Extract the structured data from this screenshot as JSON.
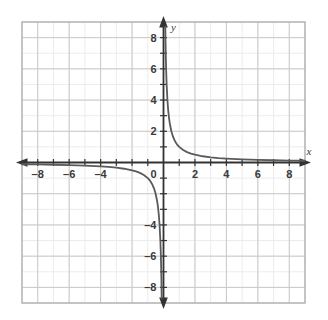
{
  "figure": {
    "kind": "coordinate-plane-graph",
    "background_color": "#ffffff",
    "frame_color": "#b0b0b0",
    "minor_grid_color": "#ececec",
    "major_grid_color": "#c9c9c9",
    "axis_color": "#333333",
    "curve_color": "#5a5a5a",
    "label_color": "#3a3a3a"
  },
  "axes": {
    "x_label": "x",
    "y_label": "y",
    "origin_label": "0",
    "x_ticks": [
      {
        "value": -8,
        "label": "–8"
      },
      {
        "value": -6,
        "label": "–6"
      },
      {
        "value": -4,
        "label": "–4"
      },
      {
        "value": 2,
        "label": "2"
      },
      {
        "value": 4,
        "label": "4"
      },
      {
        "value": 6,
        "label": "6"
      },
      {
        "value": 8,
        "label": "8"
      }
    ],
    "y_ticks": [
      {
        "value": 8,
        "label": "8"
      },
      {
        "value": 6,
        "label": "6"
      },
      {
        "value": 4,
        "label": "4"
      },
      {
        "value": 2,
        "label": "2"
      },
      {
        "value": -4,
        "label": "–4"
      },
      {
        "value": -6,
        "label": "–6"
      },
      {
        "value": -8,
        "label": "–8"
      }
    ]
  },
  "chart_data": {
    "type": "line",
    "title": "",
    "subtitle": "",
    "xlabel": "x",
    "ylabel": "y",
    "xlim": [
      -9,
      9
    ],
    "ylim": [
      -9,
      9
    ],
    "grid": true,
    "grid_step_minor": 1,
    "grid_step_major": 2,
    "legend": null,
    "function": "y = 1/x",
    "asymptotes": {
      "vertical": 0,
      "horizontal": 0
    },
    "series": [
      {
        "name": "branch-quadrant-I",
        "points": [
          [
            0.115,
            8.7
          ],
          [
            0.12,
            8.33
          ],
          [
            0.13,
            7.69
          ],
          [
            0.14,
            7.14
          ],
          [
            0.15,
            6.67
          ],
          [
            0.17,
            5.88
          ],
          [
            0.2,
            5.0
          ],
          [
            0.25,
            4.0
          ],
          [
            0.3,
            3.33
          ],
          [
            0.35,
            2.86
          ],
          [
            0.4,
            2.5
          ],
          [
            0.5,
            2.0
          ],
          [
            0.6,
            1.67
          ],
          [
            0.7,
            1.43
          ],
          [
            0.8,
            1.25
          ],
          [
            0.9,
            1.11
          ],
          [
            1.0,
            1.0
          ],
          [
            1.25,
            0.8
          ],
          [
            1.5,
            0.667
          ],
          [
            1.75,
            0.571
          ],
          [
            2.0,
            0.5
          ],
          [
            2.5,
            0.4
          ],
          [
            3.0,
            0.333
          ],
          [
            3.5,
            0.286
          ],
          [
            4.0,
            0.25
          ],
          [
            5.0,
            0.2
          ],
          [
            6.0,
            0.167
          ],
          [
            7.0,
            0.143
          ],
          [
            8.0,
            0.125
          ],
          [
            9.0,
            0.111
          ]
        ]
      },
      {
        "name": "branch-quadrant-III",
        "points": [
          [
            -9.0,
            -0.111
          ],
          [
            -8.0,
            -0.125
          ],
          [
            -7.0,
            -0.143
          ],
          [
            -6.0,
            -0.167
          ],
          [
            -5.0,
            -0.2
          ],
          [
            -4.0,
            -0.25
          ],
          [
            -3.5,
            -0.286
          ],
          [
            -3.0,
            -0.333
          ],
          [
            -2.5,
            -0.4
          ],
          [
            -2.0,
            -0.5
          ],
          [
            -1.75,
            -0.571
          ],
          [
            -1.5,
            -0.667
          ],
          [
            -1.25,
            -0.8
          ],
          [
            -1.0,
            -1.0
          ],
          [
            -0.9,
            -1.11
          ],
          [
            -0.8,
            -1.25
          ],
          [
            -0.7,
            -1.43
          ],
          [
            -0.6,
            -1.67
          ],
          [
            -0.5,
            -2.0
          ],
          [
            -0.4,
            -2.5
          ],
          [
            -0.35,
            -2.86
          ],
          [
            -0.3,
            -3.33
          ],
          [
            -0.25,
            -4.0
          ],
          [
            -0.2,
            -5.0
          ],
          [
            -0.17,
            -5.88
          ],
          [
            -0.15,
            -6.67
          ],
          [
            -0.14,
            -7.14
          ],
          [
            -0.13,
            -7.69
          ],
          [
            -0.12,
            -8.33
          ],
          [
            -0.115,
            -8.7
          ]
        ]
      }
    ]
  }
}
